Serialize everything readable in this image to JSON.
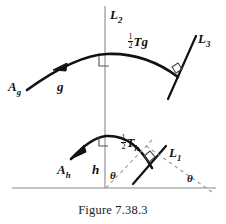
{
  "figure": {
    "caption": "Figure 7.38.3",
    "colors": {
      "curve": "#111111",
      "axis": "#8a8a8a",
      "dashed": "#9a9a9a",
      "text": "#111111"
    },
    "labels": {
      "vertical_line": {
        "base": "L",
        "sub": "2"
      },
      "upper_tangent_line": {
        "base": "L",
        "sub": "3"
      },
      "lower_tangent_line": {
        "base": "L",
        "sub": "1"
      },
      "upper_start_point": {
        "base": "A",
        "sub": "g"
      },
      "lower_start_point": {
        "base": "A",
        "sub": "h"
      },
      "upper_curve_name": "g",
      "lower_curve_name": "h",
      "upper_half_translation": {
        "half": "1/2",
        "base": "T",
        "sub": "g"
      },
      "lower_half_translation": {
        "half": "1/2",
        "base": "T",
        "sub": "h"
      },
      "angle_left": "θ",
      "angle_right": "θ"
    },
    "marks": {
      "right_angle_count": 4,
      "arrowhead_count": 2,
      "dashed_triangle": true
    }
  }
}
